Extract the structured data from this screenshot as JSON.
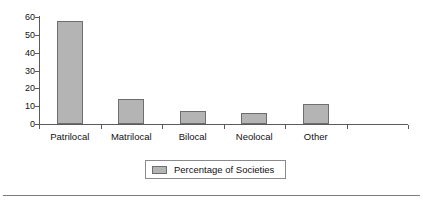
{
  "chart_data": {
    "type": "bar",
    "title": "",
    "subtitle": "",
    "xlabel": "",
    "ylabel": "",
    "categories": [
      "Patrilocal",
      "Matrilocal",
      "Bilocal",
      "Neolocal",
      "Other"
    ],
    "values": [
      58,
      14,
      7.5,
      6,
      11.5
    ],
    "series": [
      {
        "name": "Percentage of Societies",
        "values": [
          58,
          14,
          7.5,
          6,
          11.5
        ]
      }
    ],
    "ylim": [
      0,
      60
    ],
    "yticks": [
      0,
      10,
      20,
      30,
      40,
      50,
      60
    ],
    "ytick_labels": [
      "0",
      "10",
      "20",
      "30",
      "40",
      "50",
      "60"
    ],
    "grid": false,
    "legend": {
      "position": "bottom-center",
      "entries": [
        {
          "label": "Percentage of Societies",
          "color": "#b4b4b4"
        }
      ]
    },
    "colors": {
      "bar_fill": "#b4b4b4",
      "bar_stroke": "#6e6e6e",
      "axis": "#5b5b5b",
      "text": "#111111",
      "background": "#ffffff",
      "rule": "#7d7d7d"
    },
    "annotations": []
  }
}
